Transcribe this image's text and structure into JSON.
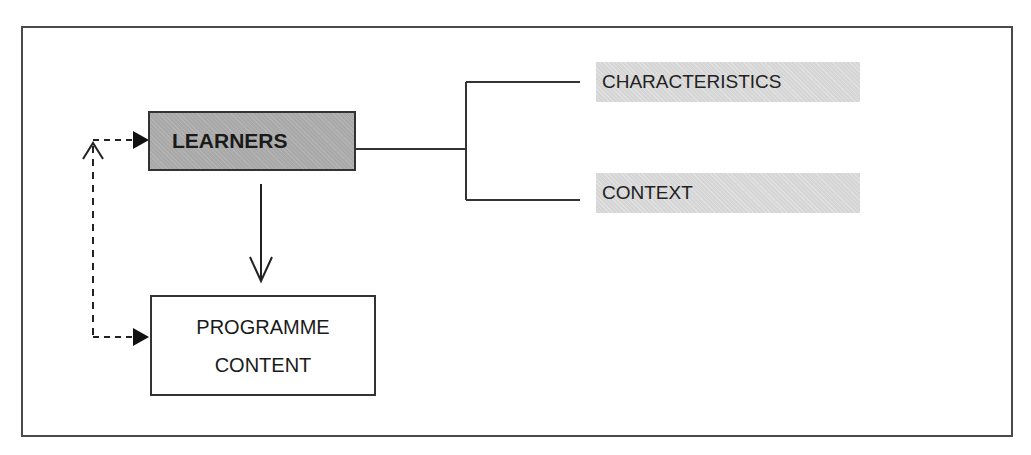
{
  "diagram": {
    "nodes": {
      "learners": "LEARNERS",
      "programme_line1": "PROGRAMME",
      "programme_line2": "CONTENT",
      "characteristics": "CHARACTERISTICS",
      "context": "CONTEXT"
    },
    "edges": [
      {
        "from": "LEARNERS",
        "to": "PROGRAMME CONTENT",
        "style": "solid",
        "arrow": "open"
      },
      {
        "from": "LEARNERS",
        "to": "CHARACTERISTICS",
        "style": "solid",
        "type": "bracket"
      },
      {
        "from": "LEARNERS",
        "to": "CONTEXT",
        "style": "solid",
        "type": "bracket"
      },
      {
        "from": "PROGRAMME CONTENT",
        "to": "LEARNERS",
        "style": "dashed",
        "arrow": "filled",
        "bidirectional": true
      }
    ],
    "colors": {
      "learners_fill": "#a9a9a9",
      "label_fill": "#d6d6d6",
      "stroke": "#333333"
    }
  }
}
